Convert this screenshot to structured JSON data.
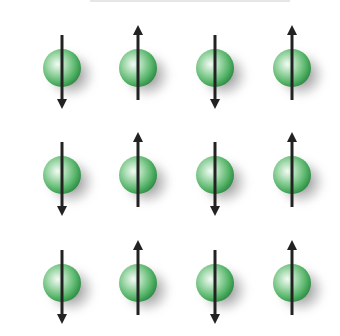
{
  "diagram": {
    "title": "",
    "colors": {
      "sphere_light": "#eaf7ec",
      "sphere_mid": "#7ccb8a",
      "sphere_dark": "#2f9a4a",
      "arrow": "#222222",
      "shadow": "#555555"
    },
    "rows": [
      {
        "y": 68,
        "spins": [
          "down",
          "up",
          "down",
          "up"
        ]
      },
      {
        "y": 175,
        "spins": [
          "down",
          "up",
          "down",
          "up"
        ]
      },
      {
        "y": 283,
        "spins": [
          "down",
          "up",
          "down",
          "up"
        ]
      }
    ],
    "columns_x": [
      62,
      138,
      215,
      292
    ],
    "sphere_radius": 19
  }
}
